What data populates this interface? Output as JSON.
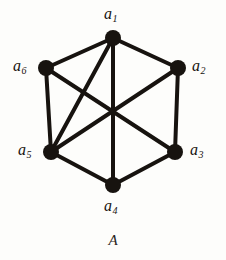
{
  "figure": {
    "caption": "A",
    "background_color": "#fdfdfb",
    "ink_color": "#17130f"
  },
  "chart_data": {
    "type": "diagram",
    "subtype": "undirected-graph",
    "title": "A",
    "vertex_radius": 8,
    "edge_width": 4,
    "nodes": [
      {
        "id": "a1",
        "label": "a",
        "subscript": "1",
        "x": 113,
        "y": 38,
        "label_x": 104,
        "label_y": 6,
        "degree": 4
      },
      {
        "id": "a2",
        "label": "a",
        "subscript": "2",
        "x": 178,
        "y": 68,
        "label_x": 192,
        "label_y": 58,
        "degree": 3
      },
      {
        "id": "a3",
        "label": "a",
        "subscript": "3",
        "x": 175,
        "y": 152,
        "label_x": 190,
        "label_y": 142,
        "degree": 3
      },
      {
        "id": "a4",
        "label": "a",
        "subscript": "4",
        "x": 113,
        "y": 185,
        "label_x": 104,
        "label_y": 198,
        "degree": 3
      },
      {
        "id": "a5",
        "label": "a",
        "subscript": "5",
        "x": 51,
        "y": 152,
        "label_x": 18,
        "label_y": 142,
        "degree": 4
      },
      {
        "id": "a6",
        "label": "a",
        "subscript": "6",
        "x": 46,
        "y": 68,
        "label_x": 13,
        "label_y": 58,
        "degree": 3
      }
    ],
    "edges": [
      {
        "from": "a1",
        "to": "a2",
        "kind": "perimeter"
      },
      {
        "from": "a2",
        "to": "a3",
        "kind": "perimeter"
      },
      {
        "from": "a3",
        "to": "a4",
        "kind": "perimeter"
      },
      {
        "from": "a4",
        "to": "a5",
        "kind": "perimeter"
      },
      {
        "from": "a5",
        "to": "a6",
        "kind": "perimeter"
      },
      {
        "from": "a6",
        "to": "a1",
        "kind": "perimeter"
      },
      {
        "from": "a1",
        "to": "a4",
        "kind": "diagonal"
      },
      {
        "from": "a1",
        "to": "a5",
        "kind": "diagonal"
      },
      {
        "from": "a2",
        "to": "a5",
        "kind": "diagonal"
      },
      {
        "from": "a6",
        "to": "a3",
        "kind": "diagonal"
      }
    ],
    "edge_count": 10,
    "node_count": 6
  }
}
